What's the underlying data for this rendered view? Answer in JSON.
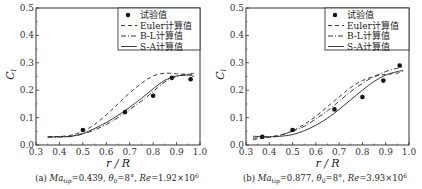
{
  "chart_data": [
    {
      "type": "line",
      "panel_label": "(a)",
      "caption": "(a) Ma_tip=0.439, θ0=8°, Re=1.92×10^6",
      "caption_parts": {
        "prefix": "(a) ",
        "ma_var": "Ma",
        "ma_sub": "tip",
        "ma_val": "=0.439, ",
        "theta_var": "θ",
        "theta_sub": "0",
        "theta_val": "=8°, ",
        "re_var": "Re",
        "re_val": "=1.92×10",
        "re_exp": "6"
      },
      "xlabel": "r / R",
      "ylabel": "C_l",
      "ylabel_main": "C",
      "ylabel_sub": "l",
      "xlim": [
        0.3,
        1.0
      ],
      "ylim": [
        0.0,
        0.5
      ],
      "xticks": [
        "0.3",
        "0.4",
        "0.5",
        "0.6",
        "0.7",
        "0.8",
        "0.9",
        "1.0"
      ],
      "yticks": [
        "0.0",
        "0.1",
        "0.2",
        "0.3",
        "0.4",
        "0.5"
      ],
      "legend_position": "top-right",
      "grid": false,
      "series": [
        {
          "name": "试验值",
          "style": "marker",
          "x": [
            0.5,
            0.68,
            0.8,
            0.88,
            0.96
          ],
          "y": [
            0.055,
            0.12,
            0.18,
            0.245,
            0.24
          ]
        },
        {
          "name": "Euler计算值",
          "style": "dashed",
          "x": [
            0.35,
            0.4,
            0.45,
            0.5,
            0.55,
            0.6,
            0.65,
            0.7,
            0.75,
            0.8,
            0.85,
            0.9,
            0.95,
            0.975
          ],
          "y": [
            0.03,
            0.031,
            0.036,
            0.05,
            0.075,
            0.11,
            0.15,
            0.19,
            0.225,
            0.252,
            0.262,
            0.26,
            0.258,
            0.26
          ]
        },
        {
          "name": "B-L计算值",
          "style": "dashdot",
          "x": [
            0.35,
            0.4,
            0.45,
            0.5,
            0.55,
            0.6,
            0.65,
            0.7,
            0.75,
            0.8,
            0.85,
            0.9,
            0.95,
            0.975
          ],
          "y": [
            0.028,
            0.029,
            0.031,
            0.04,
            0.055,
            0.075,
            0.1,
            0.13,
            0.16,
            0.195,
            0.23,
            0.25,
            0.258,
            0.262
          ]
        },
        {
          "name": "S-A计算值",
          "style": "solid",
          "x": [
            0.35,
            0.4,
            0.45,
            0.5,
            0.55,
            0.6,
            0.65,
            0.7,
            0.75,
            0.8,
            0.85,
            0.9,
            0.95,
            0.975
          ],
          "y": [
            0.03,
            0.03,
            0.032,
            0.042,
            0.06,
            0.082,
            0.108,
            0.138,
            0.17,
            0.205,
            0.236,
            0.252,
            0.255,
            0.25
          ]
        }
      ]
    },
    {
      "type": "line",
      "panel_label": "(b)",
      "caption": "(b) Ma_tip=0.877, θ0=8°, Re=3.93×10^6",
      "caption_parts": {
        "prefix": "(b) ",
        "ma_var": "Ma",
        "ma_sub": "tip",
        "ma_val": "=0.877, ",
        "theta_var": "θ",
        "theta_sub": "0",
        "theta_val": "=8°, ",
        "re_var": "Re",
        "re_val": "=3.93×10",
        "re_exp": "6"
      },
      "xlabel": "r / R",
      "ylabel": "C_l",
      "ylabel_main": "C",
      "ylabel_sub": "l",
      "xlim": [
        0.3,
        1.0
      ],
      "ylim": [
        0.0,
        0.5
      ],
      "xticks": [
        "0.3",
        "0.4",
        "0.5",
        "0.6",
        "0.7",
        "0.8",
        "0.9",
        "1.0"
      ],
      "yticks": [
        "0.0",
        "0.1",
        "0.2",
        "0.3",
        "0.4",
        "0.5"
      ],
      "legend_position": "top-right",
      "grid": false,
      "series": [
        {
          "name": "试验值",
          "style": "marker",
          "x": [
            0.37,
            0.5,
            0.68,
            0.8,
            0.89,
            0.96
          ],
          "y": [
            0.03,
            0.055,
            0.13,
            0.175,
            0.235,
            0.29
          ]
        },
        {
          "name": "Euler计算值",
          "style": "dashed",
          "x": [
            0.33,
            0.4,
            0.45,
            0.5,
            0.55,
            0.6,
            0.65,
            0.7,
            0.75,
            0.8,
            0.85,
            0.9,
            0.95,
            0.975
          ],
          "y": [
            0.02,
            0.028,
            0.037,
            0.052,
            0.075,
            0.105,
            0.14,
            0.175,
            0.21,
            0.235,
            0.25,
            0.258,
            0.262,
            0.27
          ]
        },
        {
          "name": "B-L计算值",
          "style": "dashdot",
          "x": [
            0.33,
            0.4,
            0.45,
            0.5,
            0.55,
            0.6,
            0.65,
            0.7,
            0.75,
            0.8,
            0.85,
            0.9,
            0.95,
            0.975
          ],
          "y": [
            0.025,
            0.03,
            0.036,
            0.05,
            0.068,
            0.095,
            0.125,
            0.16,
            0.195,
            0.225,
            0.25,
            0.268,
            0.28,
            0.285
          ]
        },
        {
          "name": "S-A计算值",
          "style": "solid",
          "x": [
            0.33,
            0.4,
            0.45,
            0.5,
            0.55,
            0.6,
            0.65,
            0.7,
            0.75,
            0.8,
            0.85,
            0.9,
            0.95,
            0.975
          ],
          "y": [
            0.032,
            0.03,
            0.032,
            0.038,
            0.052,
            0.072,
            0.098,
            0.13,
            0.165,
            0.2,
            0.232,
            0.255,
            0.268,
            0.272
          ]
        }
      ]
    }
  ]
}
